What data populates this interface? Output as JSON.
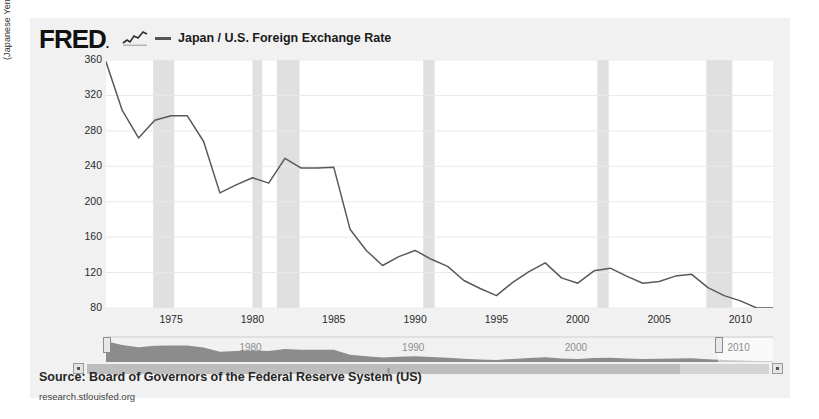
{
  "brand": {
    "logo_text": "FRED",
    "logo_dot": ".",
    "squiggle_icon": "line-chart-squiggle-icon"
  },
  "legend": {
    "series_label": "Japan / U.S. Foreign Exchange Rate",
    "swatch_color": "#555555"
  },
  "axes": {
    "y_axis_title": "(Japanese Yen to One U.S. Dollar)",
    "y_ticks": [
      360,
      320,
      280,
      240,
      200,
      160,
      120,
      80
    ],
    "x_ticks": [
      1975,
      1980,
      1985,
      1990,
      1995,
      2000,
      2005,
      2010
    ]
  },
  "navigator": {
    "year_labels": [
      "1980",
      "1990",
      "2000",
      "2010"
    ],
    "left_handle": "range-handle-left",
    "right_handle": "range-handle-right",
    "scroll_left_arrow": "◄",
    "scroll_right_arrow": "►",
    "grip_glyph": "‖"
  },
  "footer": {
    "source": "Source: Board of Governors of the Federal Reserve System (US)",
    "website": "research.stlouisfed.org"
  },
  "colors": {
    "card_background": "#f1f1f1",
    "plot_background": "#ffffff",
    "line_color": "#595959",
    "gridline_color": "#e3eaf0",
    "recession_band": "#e0e0e0",
    "navigator_area": "#8c8c8c"
  },
  "chart_data": {
    "type": "line",
    "title": "Japan / U.S. Foreign Exchange Rate",
    "xlabel": "",
    "ylabel": "(Japanese Yen to One U.S. Dollar)",
    "xlim": [
      1971,
      2012
    ],
    "ylim": [
      80,
      360
    ],
    "grid": true,
    "legend_position": "top",
    "series": [
      {
        "name": "Japan / U.S. Foreign Exchange Rate",
        "color": "#595959",
        "x": [
          1971,
          1972,
          1973,
          1974,
          1975,
          1976,
          1977,
          1978,
          1979,
          1980,
          1981,
          1982,
          1983,
          1984,
          1985,
          1986,
          1987,
          1988,
          1989,
          1990,
          1991,
          1992,
          1993,
          1994,
          1995,
          1996,
          1997,
          1998,
          1999,
          2000,
          2001,
          2002,
          2003,
          2004,
          2005,
          2006,
          2007,
          2008,
          2009,
          2010,
          2011,
          2012
        ],
        "y": [
          358,
          303,
          272,
          292,
          297,
          297,
          268,
          210,
          219,
          227,
          221,
          249,
          238,
          238,
          239,
          169,
          145,
          128,
          138,
          145,
          135,
          127,
          111,
          102,
          94,
          109,
          121,
          131,
          114,
          108,
          122,
          125,
          116,
          108,
          110,
          116,
          118,
          103,
          94,
          88,
          80,
          80
        ],
        "recession_bands": [
          [
            1973.9,
            1975.2
          ],
          [
            1980.0,
            1980.6
          ],
          [
            1981.5,
            1982.9
          ],
          [
            1990.5,
            1991.2
          ],
          [
            2001.2,
            2001.9
          ],
          [
            2007.9,
            2009.5
          ]
        ]
      }
    ]
  }
}
